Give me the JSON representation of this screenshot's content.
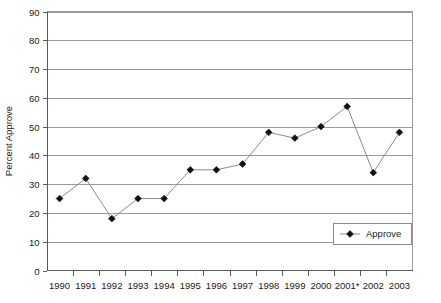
{
  "chart_data": {
    "type": "line",
    "title": "",
    "xlabel": "",
    "ylabel": "Percent Approve",
    "categories": [
      "1990",
      "1991",
      "1992",
      "1993",
      "1994",
      "1995",
      "1996",
      "1997",
      "1998",
      "1999",
      "2000",
      "2001*",
      "2002",
      "2003"
    ],
    "x_tick_labels": [
      "1990",
      "1991",
      "1992",
      "1993",
      "1994",
      "1995",
      "1996",
      "1997",
      "1998",
      "1999",
      "2000",
      "2001*",
      "2002",
      "2003"
    ],
    "y_tick_labels": [
      "0",
      "10",
      "20",
      "30",
      "40",
      "50",
      "60",
      "70",
      "80",
      "90"
    ],
    "y_ticks": [
      0,
      10,
      20,
      30,
      40,
      50,
      60,
      70,
      80,
      90
    ],
    "ylim": [
      0,
      90
    ],
    "grid": "horizontal",
    "legend_position": "inside-bottom-right",
    "series": [
      {
        "name": "Approve",
        "marker": "diamond",
        "marker_color": "#111111",
        "line_color": "#8c8c8c",
        "values": [
          25,
          32,
          18,
          25,
          25,
          35,
          35,
          37,
          48,
          46,
          50,
          57,
          34,
          48
        ]
      }
    ],
    "legend": [
      {
        "label": "Approve",
        "marker": "diamond",
        "color": "#111111"
      }
    ],
    "annotations": [
      "2001 label carries an asterisk (2001*)"
    ]
  },
  "colors": {
    "gridline": "#9a9a9a",
    "axis": "#5a5a5a",
    "series_marker": "#111111",
    "series_line": "#8c8c8c",
    "background": "#ffffff",
    "text": "#1a1a1a"
  }
}
